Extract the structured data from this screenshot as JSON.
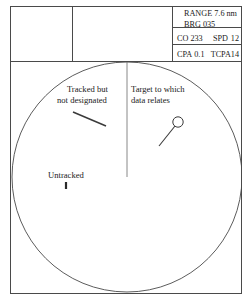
{
  "display": {
    "title": "radar-ppi-display"
  },
  "header": {
    "cells": [
      {
        "name": "blank-cell-left",
        "text": ""
      },
      {
        "name": "blank-cell-middle",
        "text": ""
      }
    ],
    "data_panel": {
      "range_label": "RANGE",
      "range_value": "7.6 nm",
      "range_line": "RANGE 7.6 nm",
      "bearing_label": "BRG",
      "bearing_value": "035",
      "bearing_line": "BRG 035",
      "course_label": "CO",
      "course_value": "233",
      "speed_label": "SPD",
      "speed_value": "12",
      "cpa_label": "CPA",
      "cpa_value": "0.1",
      "tcpa_label": "TCPA",
      "tcpa_value": "14"
    }
  },
  "scope": {
    "annotations": [
      {
        "name": "tracked-not-designated-label",
        "line1": "Tracked but",
        "line2": "not designated"
      },
      {
        "name": "target-data-relates-label",
        "line1": "Target to which",
        "line2": "data relates"
      },
      {
        "name": "untracked-label",
        "line1": "Untracked",
        "line2": ""
      }
    ],
    "contacts": [
      {
        "name": "tracked-not-designated-contact",
        "symbol": "vector-line"
      },
      {
        "name": "designated-target-contact",
        "symbol": "circle-with-vector"
      },
      {
        "name": "untracked-contact",
        "symbol": "small-tick"
      }
    ],
    "heading_line": "own-ship-heading-marker"
  },
  "colors": {
    "line": "#4a4a4a",
    "text": "#1a1a1a",
    "background": "#ffffff"
  }
}
